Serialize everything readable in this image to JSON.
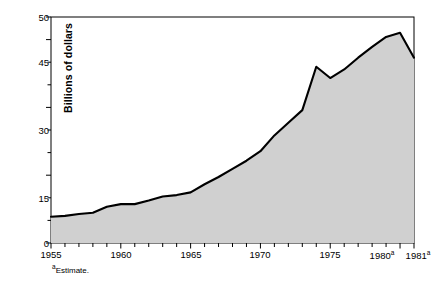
{
  "chart_data": {
    "type": "area",
    "title": "",
    "subtitle": "",
    "xlabel": "",
    "ylabel": "Billions of dollars",
    "xlim": [
      1955,
      1981
    ],
    "ylim": [
      0,
      50
    ],
    "y_ticks_major": [
      0,
      15,
      30,
      45,
      50
    ],
    "y_ticks_minor_step": 5,
    "x_ticks_major": [
      1955,
      1960,
      1965,
      1970,
      1975,
      1980,
      1981
    ],
    "x_tick_labels": [
      "1955",
      "1960",
      "1965",
      "1970",
      "1975",
      "1980",
      "1981"
    ],
    "x_tick_superscripts": [
      "",
      "",
      "",
      "",
      "",
      "a",
      "a"
    ],
    "x_ticks_minor_step": 1,
    "grid": false,
    "legend": false,
    "legend_position": "none",
    "fill_color": "#d0d0d0",
    "line_color": "#000000",
    "annotations": [
      {
        "text": "aEstimate.",
        "marker": "a",
        "label": "Estimate."
      }
    ],
    "x": [
      1955,
      1956,
      1957,
      1958,
      1959,
      1960,
      1961,
      1962,
      1963,
      1964,
      1965,
      1966,
      1967,
      1968,
      1969,
      1970,
      1971,
      1972,
      1973,
      1974,
      1975,
      1976,
      1977,
      1978,
      1979,
      1980,
      1981
    ],
    "values": [
      5.8,
      6.0,
      6.4,
      6.7,
      8.0,
      8.6,
      8.6,
      9.4,
      10.3,
      10.6,
      11.2,
      13.0,
      14.6,
      16.4,
      18.2,
      20.3,
      23.8,
      26.6,
      29.4,
      39.0,
      36.5,
      38.4,
      41.0,
      43.4,
      45.6,
      46.5,
      41.0
    ],
    "series": [
      {
        "name": "Billions of dollars",
        "values": [
          5.8,
          6.0,
          6.4,
          6.7,
          8.0,
          8.6,
          8.6,
          9.4,
          10.3,
          10.6,
          11.2,
          13.0,
          14.6,
          16.4,
          18.2,
          20.3,
          23.8,
          26.6,
          29.4,
          39.0,
          36.5,
          38.4,
          41.0,
          43.4,
          45.6,
          46.5,
          41.0
        ]
      }
    ]
  },
  "axis": {
    "y_label": "Billions of dollars",
    "y_tick_0": "0",
    "y_tick_15": "15",
    "y_tick_30": "30",
    "y_tick_45": "45",
    "y_tick_50": "50",
    "x_tick_1955": "1955",
    "x_tick_1960": "1960",
    "x_tick_1965": "1965",
    "x_tick_1970": "1970",
    "x_tick_1975": "1975",
    "x_tick_1980": "1980",
    "x_tick_1981": "1981",
    "superscript_a": "a"
  },
  "footnote": {
    "marker": "a",
    "text": "Estimate."
  }
}
